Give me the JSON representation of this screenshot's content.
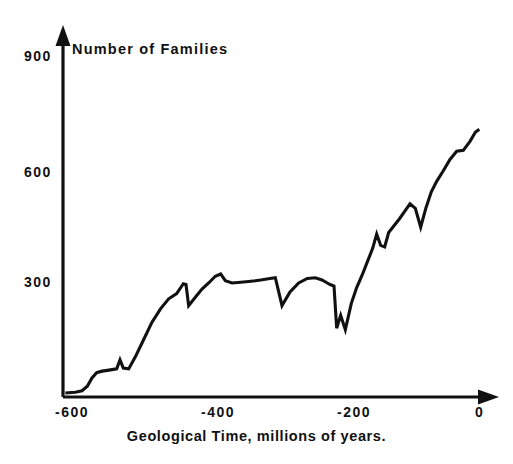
{
  "chart_data": {
    "type": "line",
    "title": "Number of Families",
    "xlabel": "Geological Time, millions of years.",
    "ylabel": "Number of Families",
    "xlim": [
      -630,
      10
    ],
    "ylim": [
      0,
      960
    ],
    "grid": false,
    "legend": false,
    "y_ticks": [
      "900",
      "600",
      "300"
    ],
    "y_tick_values": [
      900,
      600,
      300
    ],
    "x_ticks": [
      "-600",
      "-400",
      "-200",
      "0"
    ],
    "x_tick_values": [
      -600,
      -400,
      -200,
      0
    ],
    "series": [
      {
        "name": "Number of Families",
        "color": "#111111",
        "x": [
          -625,
          -610,
          -600,
          -592,
          -585,
          -578,
          -570,
          -562,
          -555,
          -548,
          -543,
          -538,
          -530,
          -520,
          -508,
          -495,
          -482,
          -470,
          -458,
          -448,
          -444,
          -440,
          -430,
          -420,
          -410,
          -400,
          -392,
          -385,
          -375,
          -362,
          -350,
          -340,
          -332,
          -325,
          -318,
          -310,
          -300,
          -288,
          -275,
          -262,
          -250,
          -240,
          -232,
          -228,
          -225,
          -222,
          -218,
          -212,
          -205,
          -196,
          -188,
          -180,
          -172,
          -164,
          -158,
          -152,
          -146,
          -140,
          -132,
          -124,
          -116,
          -108,
          -100,
          -92,
          -84,
          -76,
          -68,
          -58,
          -48,
          -38,
          -28,
          -18,
          -10,
          -4
        ],
        "y": [
          8,
          10,
          14,
          26,
          48,
          62,
          66,
          68,
          70,
          72,
          96,
          74,
          72,
          104,
          148,
          196,
          232,
          258,
          272,
          298,
          296,
          240,
          262,
          284,
          300,
          318,
          324,
          306,
          300,
          302,
          304,
          306,
          308,
          310,
          312,
          314,
          240,
          276,
          300,
          312,
          314,
          308,
          300,
          296,
          294,
          292,
          180,
          214,
          176,
          246,
          288,
          320,
          356,
          392,
          430,
          400,
          396,
          434,
          452,
          470,
          490,
          510,
          498,
          448,
          500,
          542,
          570,
          598,
          628,
          650,
          652,
          676,
          700,
          708
        ]
      }
    ]
  },
  "axes": {
    "y_arrow": "up-arrow-icon",
    "x_arrow": "right-arrow-icon"
  }
}
